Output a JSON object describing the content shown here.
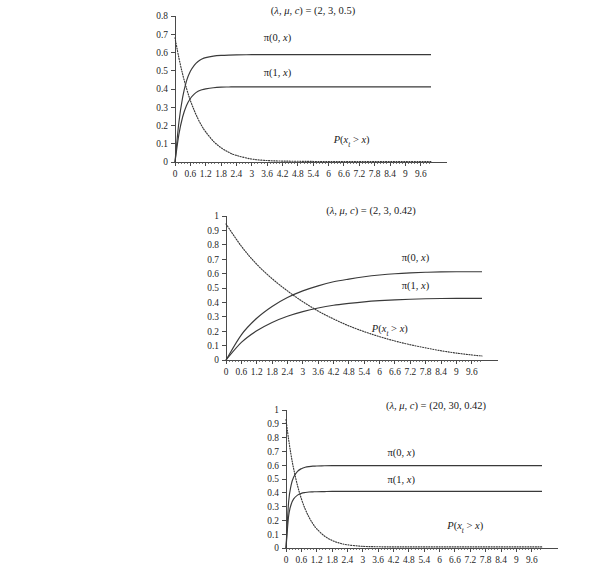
{
  "figure": {
    "background": "#ffffff",
    "panel_count": 3
  },
  "charts": [
    {
      "id": "panel-1",
      "title": "(λ, μ, c) = (2, 3, 0.5)",
      "title_parts": {
        "lambda": "λ",
        "mu": "μ",
        "c": "c",
        "values": "(2, 3, 0.5)"
      },
      "params": {
        "lambda": 2,
        "mu": 3,
        "c": 0.5
      },
      "labels": {
        "pi0": "π(0, x)",
        "pi1": "π(1, x)",
        "tail": "P(x",
        "tail_sub": "t",
        "tail_rest": " > x)"
      },
      "ytitle": "",
      "xtitle": "",
      "yticks": [
        "0",
        "0.1",
        "0.2",
        "0.3",
        "0.4",
        "0.5",
        "0.6",
        "0.7",
        "0.8"
      ],
      "xticks": [
        "0",
        "0.6",
        "1.2",
        "1.8",
        "2.4",
        "3",
        "3.6",
        "4.2",
        "4.8",
        "5.4",
        "6",
        "6.6",
        "7.2",
        "7.8",
        "8.4",
        "9",
        "9.6"
      ]
    },
    {
      "id": "panel-2",
      "title": "(λ, μ, c) = (2, 3, 0.42)",
      "title_parts": {
        "lambda": "λ",
        "mu": "μ",
        "c": "c",
        "values": "(2, 3, 0.42)"
      },
      "params": {
        "lambda": 2,
        "mu": 3,
        "c": 0.42
      },
      "labels": {
        "pi0": "π(0, x)",
        "pi1": "π(1, x)",
        "tail": "P(x",
        "tail_sub": "t",
        "tail_rest": " > x)"
      },
      "ytitle": "",
      "xtitle": "",
      "yticks": [
        "0",
        "0.1",
        "0.2",
        "0.3",
        "0.4",
        "0.5",
        "0.6",
        "0.7",
        "0.8",
        "0.9",
        "1"
      ],
      "xticks": [
        "0",
        "0.6",
        "1.2",
        "1.8",
        "2.4",
        "3",
        "3.6",
        "4.2",
        "4.8",
        "5.4",
        "6",
        "6.6",
        "7.2",
        "7.8",
        "8.4",
        "9",
        "9.6"
      ]
    },
    {
      "id": "panel-3",
      "title": "(λ, μ, c) = (20, 30, 0.42)",
      "title_parts": {
        "lambda": "λ",
        "mu": "μ",
        "c": "c",
        "values": "(20, 30, 0.42)"
      },
      "params": {
        "lambda": 20,
        "mu": 30,
        "c": 0.42
      },
      "labels": {
        "pi0": "π(0, x)",
        "pi1": "π(1, x)",
        "tail": "P(x",
        "tail_sub": "t",
        "tail_rest": " > x)"
      },
      "ytitle": "",
      "xtitle": "",
      "yticks": [
        "0",
        "0.1",
        "0.2",
        "0.3",
        "0.4",
        "0.5",
        "0.6",
        "0.7",
        "0.8",
        "0.9",
        "1"
      ],
      "xticks": [
        "0",
        "0.6",
        "1.2",
        "1.8",
        "2.4",
        "3",
        "3.6",
        "4.2",
        "4.8",
        "5.4",
        "6",
        "6.6",
        "7.2",
        "7.8",
        "8.4",
        "9",
        "9.6"
      ]
    }
  ],
  "chart_data": [
    {
      "type": "line",
      "title": "(λ, μ, c) = (2, 3, 0.5)",
      "xlabel": "",
      "ylabel": "",
      "xlim": [
        0,
        10.0
      ],
      "ylim": [
        0,
        0.8
      ],
      "grid": false,
      "legend": "inline-annotations",
      "xticks": [
        0,
        0.6,
        1.2,
        1.8,
        2.4,
        3,
        3.6,
        4.2,
        4.8,
        5.4,
        6,
        6.6,
        7.2,
        7.8,
        8.4,
        9,
        9.6
      ],
      "yticks": [
        0,
        0.1,
        0.2,
        0.3,
        0.4,
        0.5,
        0.6,
        0.7,
        0.8
      ],
      "x": [
        0,
        0.15,
        0.3,
        0.45,
        0.6,
        0.75,
        0.9,
        1.05,
        1.2,
        1.5,
        1.8,
        2.1,
        2.4,
        3.0,
        3.6,
        4.2,
        4.8,
        5.4,
        6.0,
        6.6,
        7.2,
        7.8,
        8.4,
        9.0,
        9.6,
        10.0
      ],
      "series": [
        {
          "name": "π(0, x)",
          "style": "solid",
          "values": [
            0.0,
            0.215,
            0.355,
            0.445,
            0.497,
            0.53,
            0.551,
            0.564,
            0.572,
            0.58,
            0.584,
            0.586,
            0.587,
            0.588,
            0.588,
            0.588,
            0.588,
            0.588,
            0.588,
            0.588,
            0.588,
            0.588,
            0.588,
            0.588,
            0.588,
            0.588
          ]
        },
        {
          "name": "π(1, x)",
          "style": "solid",
          "values": [
            0.0,
            0.15,
            0.248,
            0.31,
            0.348,
            0.372,
            0.387,
            0.396,
            0.401,
            0.407,
            0.41,
            0.411,
            0.412,
            0.412,
            0.412,
            0.412,
            0.412,
            0.412,
            0.412,
            0.412,
            0.412,
            0.412,
            0.412,
            0.412,
            0.412,
            0.412
          ]
        },
        {
          "name": "P(x_t > x)",
          "style": "dotted",
          "values": [
            0.68,
            0.572,
            0.48,
            0.403,
            0.337,
            0.283,
            0.236,
            0.197,
            0.165,
            0.114,
            0.078,
            0.053,
            0.036,
            0.016,
            0.008,
            0.005,
            0.004,
            0.003,
            0.003,
            0.003,
            0.003,
            0.003,
            0.003,
            0.003,
            0.003,
            0.003
          ]
        }
      ]
    },
    {
      "type": "line",
      "title": "(λ, μ, c) = (2, 3, 0.42)",
      "xlabel": "",
      "ylabel": "",
      "xlim": [
        0,
        10.0
      ],
      "ylim": [
        0,
        1.0
      ],
      "grid": false,
      "legend": "inline-annotations",
      "xticks": [
        0,
        0.6,
        1.2,
        1.8,
        2.4,
        3,
        3.6,
        4.2,
        4.8,
        5.4,
        6,
        6.6,
        7.2,
        7.8,
        8.4,
        9,
        9.6
      ],
      "yticks": [
        0,
        0.1,
        0.2,
        0.3,
        0.4,
        0.5,
        0.6,
        0.7,
        0.8,
        0.9,
        1
      ],
      "x": [
        0,
        0.6,
        1.2,
        1.8,
        2.4,
        3.0,
        3.6,
        4.2,
        4.8,
        5.4,
        6.0,
        6.6,
        7.2,
        7.8,
        8.4,
        9.0,
        9.6,
        10.0
      ],
      "series": [
        {
          "name": "π(0, x)",
          "style": "solid",
          "values": [
            0.0,
            0.175,
            0.29,
            0.372,
            0.434,
            0.48,
            0.515,
            0.543,
            0.562,
            0.578,
            0.59,
            0.599,
            0.605,
            0.609,
            0.612,
            0.613,
            0.613,
            0.613
          ]
        },
        {
          "name": "π(1, x)",
          "style": "solid",
          "values": [
            0.0,
            0.122,
            0.203,
            0.261,
            0.304,
            0.336,
            0.361,
            0.38,
            0.393,
            0.404,
            0.412,
            0.418,
            0.422,
            0.425,
            0.427,
            0.428,
            0.428,
            0.428
          ]
        },
        {
          "name": "P(x_t > x)",
          "style": "dotted",
          "values": [
            0.945,
            0.79,
            0.665,
            0.565,
            0.48,
            0.405,
            0.34,
            0.285,
            0.237,
            0.197,
            0.162,
            0.132,
            0.106,
            0.084,
            0.064,
            0.048,
            0.035,
            0.028
          ]
        }
      ]
    },
    {
      "type": "line",
      "title": "(λ, μ, c) = (20, 30, 0.42)",
      "xlabel": "",
      "ylabel": "",
      "xlim": [
        0,
        10.0
      ],
      "ylim": [
        0,
        1.0
      ],
      "grid": false,
      "legend": "inline-annotations",
      "xticks": [
        0,
        0.6,
        1.2,
        1.8,
        2.4,
        3,
        3.6,
        4.2,
        4.8,
        5.4,
        6,
        6.6,
        7.2,
        7.8,
        8.4,
        9,
        9.6
      ],
      "yticks": [
        0,
        0.1,
        0.2,
        0.3,
        0.4,
        0.5,
        0.6,
        0.7,
        0.8,
        0.9,
        1
      ],
      "x": [
        0,
        0.1,
        0.2,
        0.3,
        0.45,
        0.6,
        0.75,
        0.9,
        1.05,
        1.2,
        1.5,
        1.8,
        2.1,
        2.4,
        3.0,
        3.6,
        4.2,
        4.8,
        5.4,
        6.0,
        6.6,
        7.2,
        7.8,
        8.4,
        9.0,
        9.6,
        10.0
      ],
      "series": [
        {
          "name": "π(0, x)",
          "style": "solid",
          "values": [
            0.0,
            0.33,
            0.455,
            0.515,
            0.556,
            0.575,
            0.585,
            0.59,
            0.593,
            0.594,
            0.596,
            0.597,
            0.597,
            0.597,
            0.597,
            0.597,
            0.597,
            0.597,
            0.597,
            0.597,
            0.597,
            0.597,
            0.597,
            0.597,
            0.597,
            0.597,
            0.597
          ]
        },
        {
          "name": "π(1, x)",
          "style": "solid",
          "values": [
            0.0,
            0.228,
            0.315,
            0.356,
            0.383,
            0.396,
            0.402,
            0.406,
            0.407,
            0.408,
            0.409,
            0.41,
            0.41,
            0.41,
            0.41,
            0.41,
            0.41,
            0.41,
            0.41,
            0.41,
            0.41,
            0.41,
            0.41,
            0.41,
            0.41,
            0.41,
            0.41
          ]
        },
        {
          "name": "P(x_t > x)",
          "style": "dotted",
          "values": [
            0.93,
            0.79,
            0.672,
            0.573,
            0.452,
            0.357,
            0.282,
            0.223,
            0.176,
            0.139,
            0.087,
            0.055,
            0.035,
            0.023,
            0.012,
            0.009,
            0.008,
            0.008,
            0.008,
            0.008,
            0.008,
            0.008,
            0.008,
            0.008,
            0.008,
            0.008,
            0.008
          ]
        }
      ]
    }
  ],
  "annotations": {
    "panel_1": {
      "pi0_pos": {
        "x": 4.0,
        "y": 0.665
      },
      "pi1_pos": {
        "x": 4.0,
        "y": 0.47
      },
      "tail_pos": {
        "x": 6.9,
        "y": 0.105
      }
    },
    "panel_2": {
      "pi0_pos": {
        "x": 7.4,
        "y": 0.69
      },
      "pi1_pos": {
        "x": 7.4,
        "y": 0.49
      },
      "tail_pos": {
        "x": 6.4,
        "y": 0.195
      }
    },
    "panel_3": {
      "pi0_pos": {
        "x": 4.5,
        "y": 0.665
      },
      "pi1_pos": {
        "x": 4.5,
        "y": 0.47
      },
      "tail_pos": {
        "x": 7.0,
        "y": 0.14
      }
    }
  }
}
